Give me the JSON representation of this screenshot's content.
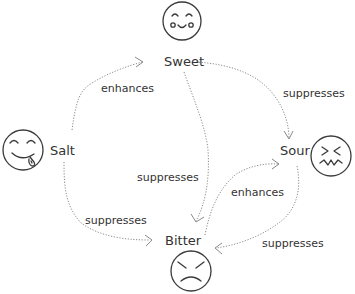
{
  "diagram": {
    "type": "taste-interaction-graph",
    "nodes": [
      {
        "id": "sweet",
        "label": "Sweet",
        "icon": "smiling-face-icon"
      },
      {
        "id": "salt",
        "label": "Salt",
        "icon": "tongue-out-face-icon"
      },
      {
        "id": "sour",
        "label": "Sour",
        "icon": "scrunched-face-icon"
      },
      {
        "id": "bitter",
        "label": "Bitter",
        "icon": "angry-face-icon"
      }
    ],
    "edges": [
      {
        "from": "salt",
        "to": "sweet",
        "label": "enhances"
      },
      {
        "from": "sweet",
        "to": "sour",
        "label": "suppresses"
      },
      {
        "from": "sweet",
        "to": "bitter",
        "label": "suppresses"
      },
      {
        "from": "salt",
        "to": "bitter",
        "label": "suppresses"
      },
      {
        "from": "bitter",
        "to": "sour",
        "label": "enhances"
      },
      {
        "from": "sour",
        "to": "bitter",
        "label": "suppresses"
      }
    ]
  },
  "labels": {
    "sweet": "Sweet",
    "salt": "Salt",
    "sour": "Sour",
    "bitter": "Bitter",
    "e_salt_sweet": "enhances",
    "e_sweet_sour": "suppresses",
    "e_sweet_bitter": "suppresses",
    "e_salt_bitter": "suppresses",
    "e_bitter_sour": "enhances",
    "e_sour_bitter": "suppresses"
  },
  "colors": {
    "stroke": "#3a3a3a",
    "edge": "#8a8a8a",
    "text": "#333333",
    "background": "#ffffff"
  }
}
